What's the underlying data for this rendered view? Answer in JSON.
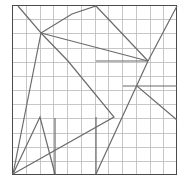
{
  "figure": {
    "title": "",
    "kind": "line-drawing-on-grid",
    "canvas": {
      "width": 186,
      "height": 184,
      "background": "#ffffff"
    },
    "frame": {
      "name": "square-border",
      "x": 12,
      "y": 5,
      "width": 165,
      "height": 170,
      "stroke": "#4a4a4a",
      "stroke_width": 1.6,
      "fill": "#ffffff"
    },
    "grid": {
      "columns": 12,
      "rows": 12,
      "stroke": "#b9b9b9",
      "stroke_width": 0.8,
      "visible": true
    },
    "polylines": {
      "stroke": "#6b6b6b",
      "stroke_width": 1.2,
      "paths": [
        {
          "name": "path-upper-chevron",
          "points": [
            [
              18,
              6
            ],
            [
              41,
              33
            ],
            [
              72,
              14
            ],
            [
              96,
              6
            ],
            [
              148,
              61
            ]
          ]
        },
        {
          "name": "path-hub-descender",
          "points": [
            [
              41,
              33
            ],
            [
              148,
              61
            ]
          ]
        },
        {
          "name": "path-left-long-spine",
          "points": [
            [
              41,
              33
            ],
            [
              13,
              174
            ]
          ]
        },
        {
          "name": "path-mid-diagonal-fan",
          "points": [
            [
              41,
              33
            ],
            [
              68,
              61
            ],
            [
              114,
              117
            ],
            [
              13,
              174
            ]
          ]
        },
        {
          "name": "path-left-zigzag",
          "points": [
            [
              13,
              174
            ],
            [
              40,
              117
            ],
            [
              55,
              174
            ]
          ]
        },
        {
          "name": "path-left-vertical",
          "points": [
            [
              55,
              118
            ],
            [
              55,
              174
            ]
          ]
        },
        {
          "name": "path-center-riser",
          "points": [
            [
              96,
              174
            ],
            [
              148,
              61
            ],
            [
              177,
              6
            ]
          ]
        },
        {
          "name": "path-center-vertical",
          "points": [
            [
              96,
              117
            ],
            [
              96,
              174
            ]
          ]
        },
        {
          "name": "path-right-junction-spokes",
          "points": [
            [
              148,
              61
            ],
            [
              96,
              61
            ]
          ]
        },
        {
          "name": "path-right-shallow-v",
          "points": [
            [
              123,
              86
            ],
            [
              137,
              86
            ],
            [
              177,
              120
            ]
          ]
        },
        {
          "name": "path-right-edge-link",
          "points": [
            [
              137,
              86
            ],
            [
              177,
              86
            ]
          ]
        }
      ]
    }
  }
}
